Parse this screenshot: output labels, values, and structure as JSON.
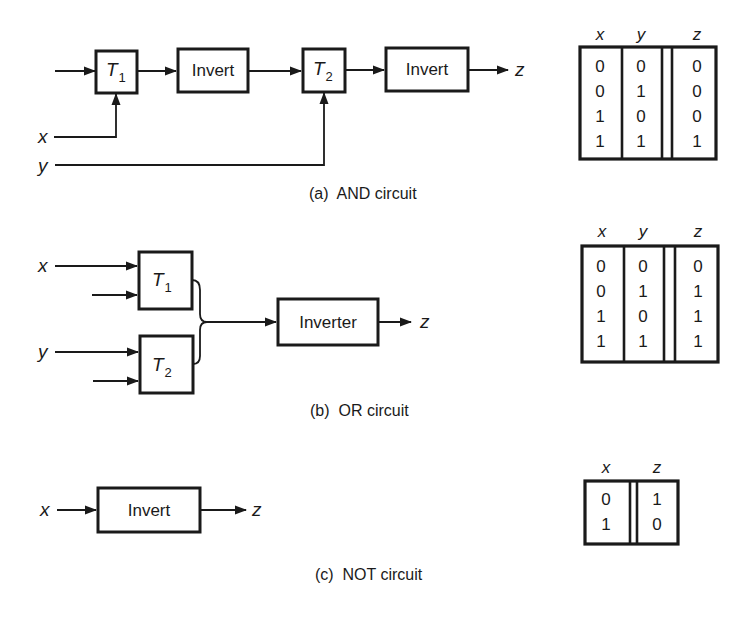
{
  "figure": {
    "panels": [
      {
        "id": "a",
        "caption": "(a)  AND circuit",
        "inputs": [
          "x",
          "y"
        ],
        "output": "z",
        "blocks": [
          {
            "label": "T",
            "subscript": "1"
          },
          {
            "label": "Invert"
          },
          {
            "label": "T",
            "subscript": "2"
          },
          {
            "label": "Invert"
          }
        ],
        "truth_table": {
          "headers": [
            "x",
            "y",
            "z"
          ],
          "rows": [
            [
              "0",
              "0",
              "0"
            ],
            [
              "0",
              "1",
              "0"
            ],
            [
              "1",
              "0",
              "0"
            ],
            [
              "1",
              "1",
              "1"
            ]
          ]
        }
      },
      {
        "id": "b",
        "caption": "(b)  OR circuit",
        "inputs": [
          "x",
          "y"
        ],
        "output": "z",
        "blocks": [
          {
            "label": "T",
            "subscript": "1"
          },
          {
            "label": "T",
            "subscript": "2"
          },
          {
            "label": "Inverter"
          }
        ],
        "truth_table": {
          "headers": [
            "x",
            "y",
            "z"
          ],
          "rows": [
            [
              "0",
              "0",
              "0"
            ],
            [
              "0",
              "1",
              "1"
            ],
            [
              "1",
              "0",
              "1"
            ],
            [
              "1",
              "1",
              "1"
            ]
          ]
        }
      },
      {
        "id": "c",
        "caption": "(c)  NOT circuit",
        "inputs": [
          "x"
        ],
        "output": "z",
        "blocks": [
          {
            "label": "Invert"
          }
        ],
        "truth_table": {
          "headers": [
            "x",
            "z"
          ],
          "rows": [
            [
              "0",
              "1"
            ],
            [
              "1",
              "0"
            ]
          ]
        }
      }
    ]
  }
}
